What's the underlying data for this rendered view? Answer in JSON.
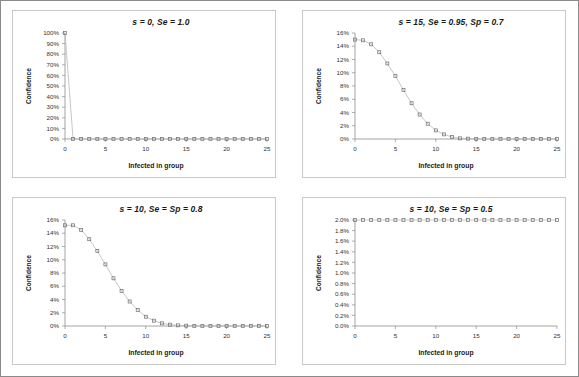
{
  "figure": {
    "name": "four-panel-confidence-plots",
    "panel_count": 4
  },
  "chart_data": [
    {
      "type": "line",
      "id": "panel-top-left",
      "title": "s = 0, Se = 1.0",
      "xlabel": "Infected in group",
      "ylabel": "Confidence",
      "xlim": [
        0,
        25
      ],
      "ylim": [
        0,
        100
      ],
      "xticks": [
        0,
        5,
        10,
        15,
        20,
        25
      ],
      "xticklabels": [
        "0",
        "5",
        "10",
        "15",
        "20",
        "25"
      ],
      "yticks": [
        0,
        10,
        20,
        30,
        40,
        50,
        60,
        70,
        80,
        90,
        100
      ],
      "yticklabels": [
        "0%",
        "10%",
        "20%",
        "30%",
        "40%",
        "50%",
        "60%",
        "70%",
        "80%",
        "90%",
        "100%"
      ],
      "grid": false,
      "legend": null,
      "marker": "open-square",
      "x": [
        0,
        1,
        2,
        3,
        4,
        5,
        6,
        7,
        8,
        9,
        10,
        11,
        12,
        13,
        14,
        15,
        16,
        17,
        18,
        19,
        20,
        21,
        22,
        23,
        24,
        25
      ],
      "values": [
        100,
        0,
        0,
        0,
        0,
        0,
        0,
        0,
        0,
        0,
        0,
        0,
        0,
        0,
        0,
        0,
        0,
        0,
        0,
        0,
        0,
        0,
        0,
        0,
        0,
        0
      ]
    },
    {
      "type": "line",
      "id": "panel-top-right",
      "title": "s = 15, Se = 0.95, Sp = 0.7",
      "xlabel": "Infected in group",
      "ylabel": "Confidence",
      "xlim": [
        0,
        25
      ],
      "ylim": [
        0,
        16
      ],
      "xticks": [
        0,
        5,
        10,
        15,
        20,
        25
      ],
      "xticklabels": [
        "0",
        "5",
        "10",
        "15",
        "20",
        "25"
      ],
      "yticks": [
        0,
        2,
        4,
        6,
        8,
        10,
        12,
        14,
        16
      ],
      "yticklabels": [
        "0%",
        "2%",
        "4%",
        "6%",
        "8%",
        "10%",
        "12%",
        "14%",
        "16%"
      ],
      "grid": false,
      "legend": null,
      "marker": "open-square",
      "x": [
        0,
        1,
        2,
        3,
        4,
        5,
        6,
        7,
        8,
        9,
        10,
        11,
        12,
        13,
        14,
        15,
        16,
        17,
        18,
        19,
        20,
        21,
        22,
        23,
        24,
        25
      ],
      "values": [
        15.0,
        14.9,
        14.3,
        13.1,
        11.4,
        9.5,
        7.4,
        5.4,
        3.7,
        2.3,
        1.3,
        0.7,
        0.3,
        0.1,
        0.05,
        0.02,
        0,
        0,
        0,
        0,
        0,
        0,
        0,
        0,
        0,
        0
      ]
    },
    {
      "type": "line",
      "id": "panel-bottom-left",
      "title": "s = 10, Se = Sp = 0.8",
      "xlabel": "Infected in group",
      "ylabel": "Confidence",
      "xlim": [
        0,
        25
      ],
      "ylim": [
        0,
        16
      ],
      "xticks": [
        0,
        5,
        10,
        15,
        20,
        25
      ],
      "xticklabels": [
        "0",
        "5",
        "10",
        "15",
        "20",
        "25"
      ],
      "yticks": [
        0,
        2,
        4,
        6,
        8,
        10,
        12,
        14,
        16
      ],
      "yticklabels": [
        "0%",
        "2%",
        "4%",
        "6%",
        "8%",
        "10%",
        "12%",
        "14%",
        "16%"
      ],
      "grid": false,
      "legend": null,
      "marker": "open-square",
      "x": [
        0,
        1,
        2,
        3,
        4,
        5,
        6,
        7,
        8,
        9,
        10,
        11,
        12,
        13,
        14,
        15,
        16,
        17,
        18,
        19,
        20,
        21,
        22,
        23,
        24,
        25
      ],
      "values": [
        15.2,
        15.2,
        14.5,
        13.1,
        11.3,
        9.3,
        7.2,
        5.3,
        3.7,
        2.4,
        1.4,
        0.8,
        0.4,
        0.2,
        0.1,
        0.05,
        0,
        0,
        0,
        0,
        0,
        0,
        0,
        0,
        0,
        0
      ]
    },
    {
      "type": "line",
      "id": "panel-bottom-right",
      "title": "s = 10, Se = Sp = 0.5",
      "xlabel": "Infected in group",
      "ylabel": "Confidence",
      "xlim": [
        0,
        25
      ],
      "ylim": [
        0,
        2.0
      ],
      "xticks": [
        0,
        5,
        10,
        15,
        20,
        25
      ],
      "xticklabels": [
        "0",
        "5",
        "10",
        "15",
        "20",
        "25"
      ],
      "yticks": [
        0,
        0.2,
        0.4,
        0.6,
        0.8,
        1.0,
        1.2,
        1.4,
        1.6,
        1.8,
        2.0
      ],
      "yticklabels": [
        "0.0%",
        "0.2%",
        "0.4%",
        "0.6%",
        "0.8%",
        "1.0%",
        "1.2%",
        "1.4%",
        "1.6%",
        "1.8%",
        "2.0%"
      ],
      "grid": false,
      "legend": null,
      "marker": "open-square",
      "x": [
        0,
        1,
        2,
        3,
        4,
        5,
        6,
        7,
        8,
        9,
        10,
        11,
        12,
        13,
        14,
        15,
        16,
        17,
        18,
        19,
        20,
        21,
        22,
        23,
        24,
        25
      ],
      "values": [
        2.0,
        2.0,
        2.0,
        2.0,
        2.0,
        2.0,
        2.0,
        2.0,
        2.0,
        2.0,
        2.0,
        2.0,
        2.0,
        2.0,
        2.0,
        2.0,
        2.0,
        2.0,
        2.0,
        2.0,
        2.0,
        2.0,
        2.0,
        2.0,
        2.0,
        2.0
      ]
    }
  ]
}
